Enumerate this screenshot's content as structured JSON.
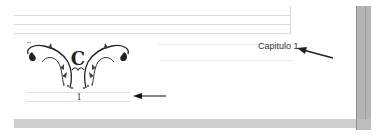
{
  "document": {
    "chapter_title": "Capitulo 1",
    "page_number": "1",
    "ornament": {
      "initial": "C",
      "description": "decorative floral chapter header ornament"
    }
  },
  "annotations": {
    "arrow_to_chapter_title": "arrow pointing left to chapter title",
    "arrow_to_page_number": "arrow pointing left to page number"
  },
  "colors": {
    "page_background": "#ffffff",
    "scrollbar": "#b4b4b4",
    "guide_lines": "#dcdcdc",
    "text": "#333333"
  }
}
